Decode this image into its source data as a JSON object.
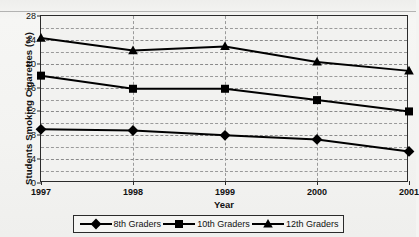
{
  "chart_data": {
    "type": "line",
    "title": "",
    "xlabel": "Year",
    "ylabel": "Students Smoking Cigarettes (%)",
    "categories": [
      "1997",
      "1998",
      "1999",
      "2000",
      "2001"
    ],
    "ylim": [
      0,
      28
    ],
    "ytick_labels": [
      "0",
      "4",
      "8",
      "12",
      "16",
      "20",
      "24",
      "28"
    ],
    "ytick_values": [
      0,
      4,
      8,
      12,
      16,
      20,
      24,
      28
    ],
    "yminor_step": 2,
    "grid": "dashed horizontal and vertical gridlines",
    "legend_position": "bottom",
    "series": [
      {
        "name": "8th Graders",
        "marker": "diamond",
        "color": "#000000",
        "values": [
          9.0,
          8.8,
          8.0,
          7.3,
          5.3
        ]
      },
      {
        "name": "10th Graders",
        "marker": "square",
        "color": "#000000",
        "values": [
          18.0,
          15.8,
          15.8,
          13.9,
          12.0
        ]
      },
      {
        "name": "12th Graders",
        "marker": "triangle",
        "color": "#000000",
        "values": [
          24.3,
          22.2,
          22.9,
          20.3,
          18.8
        ]
      }
    ]
  },
  "legend": {
    "items": [
      {
        "label": "8th Graders",
        "marker": "diamond-marker-icon"
      },
      {
        "label": "10th Graders",
        "marker": "square-marker-icon"
      },
      {
        "label": "12th Graders",
        "marker": "triangle-marker-icon"
      }
    ]
  },
  "colors": {
    "ink": "#111111",
    "axis": "#2b2b2b",
    "grid": "#9a9a9a",
    "plot_background": "#f2f2f0",
    "page_background": "#f4f4f2"
  }
}
